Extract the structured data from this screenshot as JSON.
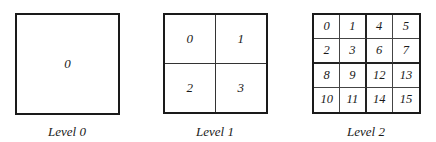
{
  "diagram": {
    "panels": [
      {
        "label": "Level 0",
        "cells": [
          "0"
        ]
      },
      {
        "label": "Level 1",
        "cells": [
          "0",
          "1",
          "2",
          "3"
        ]
      },
      {
        "label": "Level 2",
        "cells": [
          "0",
          "1",
          "4",
          "5",
          "2",
          "3",
          "6",
          "7",
          "8",
          "9",
          "12",
          "13",
          "10",
          "11",
          "14",
          "15"
        ]
      }
    ]
  }
}
